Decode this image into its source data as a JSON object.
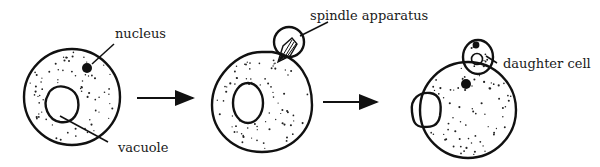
{
  "diagram": {
    "stages": [
      {
        "id": "stage-1",
        "description": "parent cell with nucleus and vacuole"
      },
      {
        "id": "stage-2",
        "description": "bud forming with spindle apparatus"
      },
      {
        "id": "stage-3",
        "description": "daughter cell formed"
      }
    ],
    "labels": {
      "nucleus": "nucleus",
      "vacuole": "vacuole",
      "spindle": "spindle apparatus",
      "daughter": "daughter cell"
    },
    "arrows": [
      {
        "from": "stage-1",
        "to": "stage-2"
      },
      {
        "from": "stage-2",
        "to": "stage-3"
      }
    ],
    "colors": {
      "ink": "#111111",
      "background": "#ffffff"
    }
  }
}
